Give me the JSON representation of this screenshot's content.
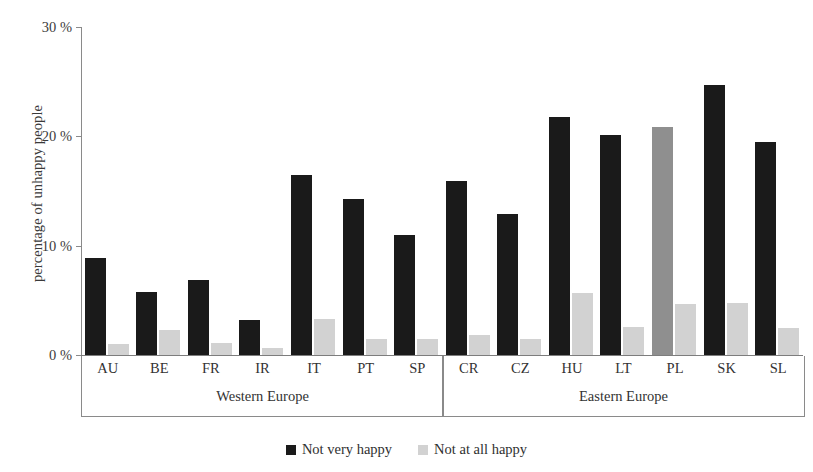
{
  "chart_data": {
    "type": "bar",
    "title": "",
    "subtitle": "",
    "xlabel": "",
    "ylabel": "percentage of unhappy people",
    "ylim": [
      0,
      30
    ],
    "yticks": [
      0,
      10,
      20,
      30
    ],
    "ytick_labels": [
      "0 %",
      "10 %",
      "20 %",
      "30 %"
    ],
    "grid": false,
    "legend_position": "bottom-center",
    "categories": [
      "AU",
      "BE",
      "FR",
      "IR",
      "IT",
      "PT",
      "SP",
      "CR",
      "CZ",
      "HU",
      "LT",
      "PL",
      "SK",
      "SL"
    ],
    "groups": [
      {
        "label": "Western Europe",
        "categories": [
          "AU",
          "BE",
          "FR",
          "IR",
          "IT",
          "PT",
          "SP"
        ]
      },
      {
        "label": "Eastern Europe",
        "categories": [
          "CR",
          "CZ",
          "HU",
          "LT",
          "PL",
          "SK",
          "SL"
        ]
      }
    ],
    "series": [
      {
        "name": "Not very happy",
        "color": "#1a1a1a",
        "values": [
          8.9,
          5.8,
          6.9,
          3.2,
          16.5,
          14.3,
          11.0,
          15.9,
          12.9,
          21.8,
          20.1,
          20.9,
          24.7,
          19.5
        ]
      },
      {
        "name": "Not at all happy",
        "color": "#d2d2d2",
        "values": [
          1.0,
          2.3,
          1.1,
          0.6,
          3.3,
          1.5,
          1.5,
          1.8,
          1.5,
          5.7,
          2.6,
          4.7,
          4.8,
          2.5
        ]
      }
    ],
    "legend": [
      "Not very happy",
      "Not at all happy"
    ]
  },
  "legend": {
    "items": [
      {
        "label": "Not very happy",
        "swatch": "dark"
      },
      {
        "label": "Not at all happy",
        "swatch": "light"
      }
    ]
  },
  "axis": {
    "y_title": "percentage of unhappy people"
  }
}
